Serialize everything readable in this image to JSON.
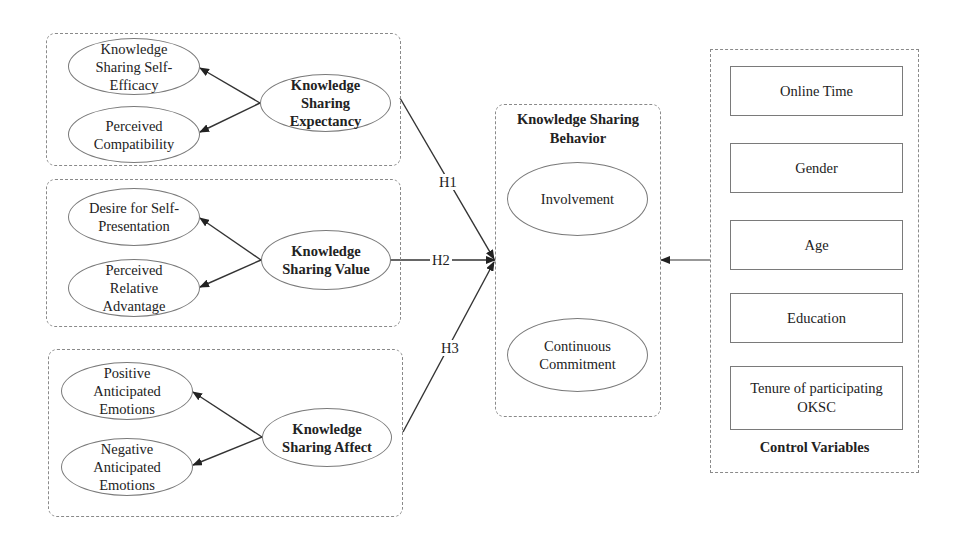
{
  "groups": {
    "expectancy": {
      "main": "Knowledge\nSharing\nExpectancy",
      "items": [
        "Knowledge\nSharing Self-\nEfficacy",
        "Perceived\nCompatibility"
      ]
    },
    "value": {
      "main": "Knowledge\nSharing Value",
      "items": [
        "Desire for Self-\nPresentation",
        "Perceived\nRelative\nAdvantage"
      ]
    },
    "affect": {
      "main": "Knowledge\nSharing Affect",
      "items": [
        "Positive\nAnticipated\nEmotions",
        "Negative\nAnticipated\nEmotions"
      ]
    }
  },
  "hypotheses": [
    "H1",
    "H2",
    "H3"
  ],
  "behavior": {
    "title": "Knowledge Sharing\nBehavior",
    "items": [
      "Involvement",
      "Continuous\nCommitment"
    ]
  },
  "controls": {
    "title": "Control Variables",
    "items": [
      "Online Time",
      "Gender",
      "Age",
      "Education",
      "Tenure of participating\nOKSC"
    ]
  },
  "colors": {
    "line": "#333333",
    "border": "#7a7a7a",
    "dashed": "#8a8a8a"
  }
}
